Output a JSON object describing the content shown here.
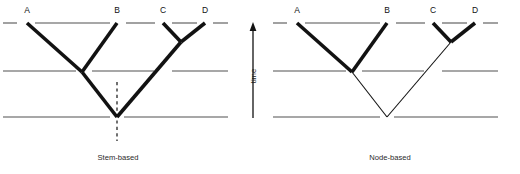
{
  "figure": {
    "background_color": "#ffffff",
    "width": 520,
    "height": 174
  },
  "axis": {
    "label": "time",
    "direction": "up",
    "icon": "up-arrow-icon",
    "color": "#121212",
    "x": 253,
    "y_top": 22,
    "y_bottom": 118
  },
  "horizons": {
    "color": "#8a8a8a",
    "levels": [
      {
        "name": "upper-horizon",
        "y": 23
      },
      {
        "name": "middle-horizon",
        "y": 71
      },
      {
        "name": "lower-horizon",
        "y": 117
      }
    ]
  },
  "taxa": [
    {
      "id": "A",
      "label": "A"
    },
    {
      "id": "B",
      "label": "B"
    },
    {
      "id": "C",
      "label": "C"
    },
    {
      "id": "D",
      "label": "D"
    }
  ],
  "panels": [
    {
      "id": "stem-based",
      "caption": "Stem-based",
      "caption_x": 118,
      "caption_y": 160,
      "highlight_color": "#121212",
      "tips": [
        {
          "id": "A",
          "label": "A",
          "x": 27,
          "y": 23,
          "label_x": 27,
          "label_y": 13
        },
        {
          "id": "B",
          "label": "B",
          "x": 117,
          "y": 23,
          "label_x": 117,
          "label_y": 13
        },
        {
          "id": "C",
          "label": "C",
          "x": 163,
          "y": 23,
          "label_x": 163,
          "label_y": 13
        },
        {
          "id": "D",
          "label": "D",
          "x": 205,
          "y": 23,
          "label_x": 205,
          "label_y": 13
        }
      ],
      "nodes": [
        {
          "id": "node-AB",
          "x": 82,
          "y": 72
        },
        {
          "id": "node-CD",
          "x": 181,
          "y": 42
        },
        {
          "id": "node-root",
          "x": 117,
          "y": 117
        }
      ],
      "thick_branches": [
        {
          "name": "branch-A",
          "from": [
            27,
            23
          ],
          "to": [
            82,
            72
          ]
        },
        {
          "name": "branch-B",
          "from": [
            117,
            23
          ],
          "to": [
            82,
            72
          ]
        },
        {
          "name": "branch-C",
          "from": [
            163,
            23
          ],
          "to": [
            181,
            42
          ]
        },
        {
          "name": "branch-D",
          "from": [
            205,
            23
          ],
          "to": [
            181,
            42
          ]
        },
        {
          "name": "branch-AB-stem",
          "from": [
            82,
            72
          ],
          "to": [
            117,
            117
          ]
        },
        {
          "name": "branch-CD-stem",
          "from": [
            181,
            42
          ],
          "to": [
            117,
            117
          ]
        }
      ],
      "thin_branches": [],
      "stem_dash": {
        "name": "stem-dashed-line",
        "x": 117,
        "y_top": 82,
        "y_bottom": 141
      },
      "horizon_segments": [
        {
          "level": 23,
          "segments": [
            [
              3,
              17
            ],
            [
              35,
              110
            ],
            [
              126,
              155
            ],
            [
              172,
              197
            ],
            [
              213,
              228
            ]
          ]
        },
        {
          "level": 71,
          "segments": [
            [
              3,
              76
            ],
            [
              92,
              154
            ],
            [
              172,
              228
            ]
          ]
        },
        {
          "level": 117,
          "segments": [
            [
              3,
              110
            ],
            [
              124,
              228
            ]
          ]
        }
      ]
    },
    {
      "id": "node-based",
      "caption": "Node-based",
      "caption_x": 390,
      "caption_y": 160,
      "highlight_color": "#121212",
      "tips": [
        {
          "id": "A",
          "label": "A",
          "x": 297,
          "y": 23,
          "label_x": 297,
          "label_y": 13
        },
        {
          "id": "B",
          "label": "B",
          "x": 387,
          "y": 23,
          "label_x": 387,
          "label_y": 13
        },
        {
          "id": "C",
          "label": "C",
          "x": 433,
          "y": 23,
          "label_x": 433,
          "label_y": 13
        },
        {
          "id": "D",
          "label": "D",
          "x": 475,
          "y": 23,
          "label_x": 475,
          "label_y": 13
        }
      ],
      "nodes": [
        {
          "id": "node-AB",
          "x": 352,
          "y": 72
        },
        {
          "id": "node-CD",
          "x": 451,
          "y": 42
        },
        {
          "id": "node-root",
          "x": 387,
          "y": 117
        }
      ],
      "thick_branches": [
        {
          "name": "branch-A",
          "from": [
            297,
            23
          ],
          "to": [
            352,
            72
          ]
        },
        {
          "name": "branch-B",
          "from": [
            387,
            23
          ],
          "to": [
            352,
            72
          ]
        },
        {
          "name": "branch-C",
          "from": [
            433,
            23
          ],
          "to": [
            451,
            42
          ]
        },
        {
          "name": "branch-D",
          "from": [
            475,
            23
          ],
          "to": [
            451,
            42
          ]
        }
      ],
      "thin_branches": [
        {
          "name": "branch-AB-stem",
          "from": [
            352,
            72
          ],
          "to": [
            387,
            117
          ]
        },
        {
          "name": "branch-CD-stem",
          "from": [
            451,
            42
          ],
          "to": [
            387,
            117
          ]
        }
      ],
      "stem_dash": null,
      "horizon_segments": [
        {
          "level": 23,
          "segments": [
            [
              273,
              287
            ],
            [
              305,
              380
            ],
            [
              396,
              425
            ],
            [
              442,
              467
            ],
            [
              483,
              498
            ]
          ]
        },
        {
          "level": 71,
          "segments": [
            [
              273,
              346
            ],
            [
              362,
              424
            ],
            [
              442,
              498
            ]
          ]
        },
        {
          "level": 117,
          "segments": [
            [
              273,
              380
            ],
            [
              394,
              498
            ]
          ]
        }
      ]
    }
  ]
}
